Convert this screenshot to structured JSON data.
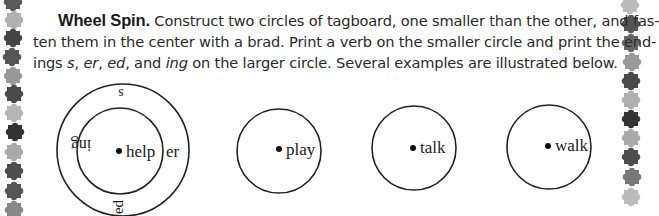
{
  "instructions": {
    "title": "Wheel Spin.",
    "line1_rest": "Construct two circles of tagboard, one smaller than the other, and fas-",
    "line2": "ten them in the center with a brad. Print a verb on the smaller circle and print the end-",
    "line3_parts": {
      "a": "ings ",
      "s": "s",
      "b": ", ",
      "er": "er",
      "c": ", ",
      "ed": "ed",
      "d": ", and ",
      "ing": "ing",
      "e": " on the larger circle. Several examples are illustrated below."
    }
  },
  "wheels": [
    {
      "verb": "help",
      "endings": {
        "top": "s",
        "right": "er",
        "bottom": "ed",
        "left": "ing"
      },
      "has_outer_ring": true
    },
    {
      "verb": "play",
      "has_outer_ring": false
    },
    {
      "verb": "talk",
      "has_outer_ring": false
    },
    {
      "verb": "walk",
      "has_outer_ring": false
    }
  ],
  "border": {
    "decoration": "puzzle-pieces",
    "colors": [
      "#5a5a5a",
      "#a8a8a8",
      "#3c3c3c",
      "#8a8a8a"
    ]
  }
}
